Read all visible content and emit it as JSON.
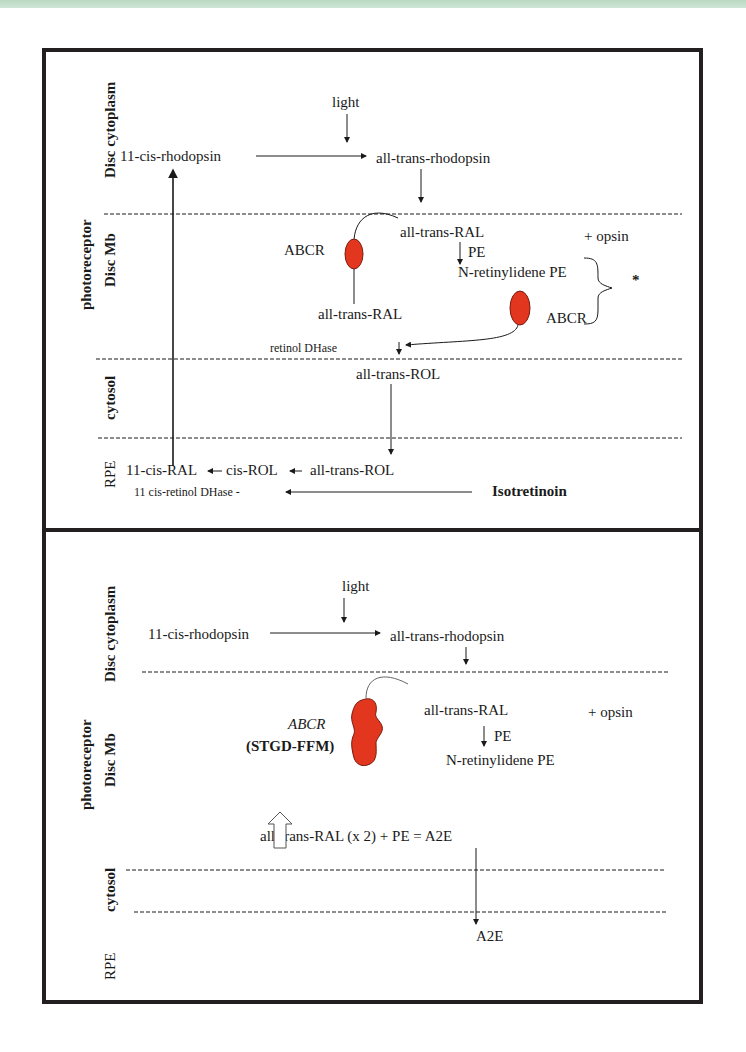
{
  "colors": {
    "protein": "#e2361e",
    "protein_outline": "#7a1b10",
    "border": "#231f20",
    "top_band": "#c4dfcc",
    "text": "#1a1a1a"
  },
  "panel_a": {
    "side_labels": {
      "disc_cytoplasm": "Disc cytoplasm",
      "photoreceptor": "photoreceptor",
      "disc_mb": "Disc Mb",
      "cytosol": "cytosol",
      "rpe": "RPE"
    },
    "nodes": {
      "light": "light",
      "cis_rhodopsin": "11-cis-rhodopsin",
      "trans_rhodopsin": "all-trans-rhodopsin",
      "all_trans_ral": "all-trans-RAL",
      "plus_opsin": "+ opsin",
      "pe": "PE",
      "n_retinylidene_pe": "N-retinylidene PE",
      "abcr_left": "ABCR",
      "abcr_right": "ABCR",
      "all_trans_ral_lower": "all-trans-RAL",
      "asterisk": "*",
      "retinol_dhase": "retinol DHase",
      "all_trans_rol_cytosol": "all-trans-ROL",
      "cis_ral_11": "11-cis-RAL",
      "cis_rol": "cis-ROL",
      "all_trans_rol_rpe": "all-trans-ROL",
      "cis_retinol_dhase": "11 cis-retinol DHase -",
      "isotretinoin": "Isotretinoin"
    }
  },
  "panel_b": {
    "side_labels": {
      "disc_cytoplasm": "Disc cytoplasm",
      "photoreceptor": "photoreceptor",
      "disc_mb": "Disc Mb",
      "cytosol": "cytosol",
      "rpe": "RPE"
    },
    "nodes": {
      "light": "light",
      "cis_rhodopsin": "11-cis-rhodopsin",
      "trans_rhodopsin": "all-trans-rhodopsin",
      "all_trans_ral": "all-trans-RAL",
      "plus_opsin": "+ opsin",
      "pe": "PE",
      "n_retinylidene_pe": "N-retinylidene PE",
      "abcr": "ABCR",
      "stgd_ffm": "(STGD-FFM)",
      "a2e_equation": "all-trans-RAL (x 2) + PE = A2E",
      "a2e": "A2E"
    }
  }
}
